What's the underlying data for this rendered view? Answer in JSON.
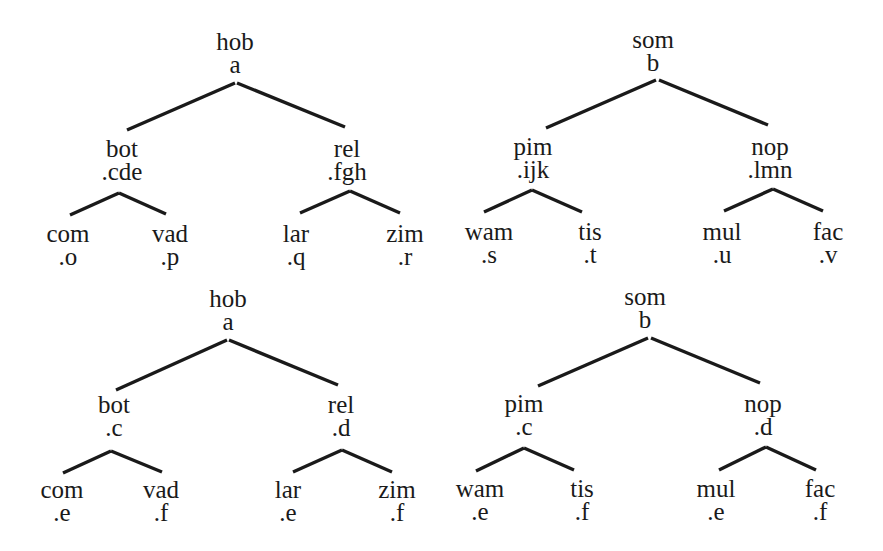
{
  "diagram": {
    "type": "tree-set",
    "colors": {
      "ink": "#1a1a1a",
      "background": "#ffffff"
    },
    "trees": [
      {
        "id": "top-left",
        "root": {
          "word": "hob",
          "tag": "a",
          "x": 235,
          "y": 30
        },
        "children": [
          {
            "word": "bot",
            "tag": ".cde",
            "x": 122,
            "y": 137,
            "children": [
              {
                "word": "com",
                "tag": ".o",
                "x": 68,
                "y": 222
              },
              {
                "word": "vad",
                "tag": ".p",
                "x": 170,
                "y": 222
              }
            ]
          },
          {
            "word": "rel",
            "tag": ".fgh",
            "x": 347,
            "y": 137,
            "children": [
              {
                "word": "lar",
                "tag": ".q",
                "x": 296,
                "y": 222
              },
              {
                "word": "zim",
                "tag": ".r",
                "x": 405,
                "y": 222
              }
            ]
          }
        ],
        "edges": [
          [
            235,
            83,
            127,
            130
          ],
          [
            237,
            83,
            345,
            127
          ],
          [
            119,
            193,
            70,
            215
          ],
          [
            119,
            193,
            166,
            214
          ],
          [
            350,
            191,
            300,
            213
          ],
          [
            350,
            191,
            400,
            213
          ]
        ]
      },
      {
        "id": "top-right",
        "root": {
          "word": "som",
          "tag": "b",
          "x": 653,
          "y": 28
        },
        "children": [
          {
            "word": "pim",
            "tag": ".ijk",
            "x": 533,
            "y": 135,
            "children": [
              {
                "word": "wam",
                "tag": ".s",
                "x": 489,
                "y": 220
              },
              {
                "word": "tis",
                "tag": ".t",
                "x": 590,
                "y": 220
              }
            ]
          },
          {
            "word": "nop",
            "tag": ".lmn",
            "x": 770,
            "y": 135,
            "children": [
              {
                "word": "mul",
                "tag": ".u",
                "x": 722,
                "y": 220
              },
              {
                "word": "fac",
                "tag": ".v",
                "x": 828,
                "y": 220
              }
            ]
          }
        ],
        "edges": [
          [
            656,
            80,
            546,
            128
          ],
          [
            659,
            80,
            768,
            125
          ],
          [
            532,
            190,
            484,
            212
          ],
          [
            532,
            190,
            582,
            212
          ],
          [
            773,
            189,
            724,
            211
          ],
          [
            773,
            189,
            823,
            211
          ]
        ]
      },
      {
        "id": "bottom-left",
        "root": {
          "word": "hob",
          "tag": "a",
          "x": 228,
          "y": 287
        },
        "children": [
          {
            "word": "bot",
            "tag": ".c",
            "x": 114,
            "y": 393,
            "children": [
              {
                "word": "com",
                "tag": ".e",
                "x": 62,
                "y": 478
              },
              {
                "word": "vad",
                "tag": ".f",
                "x": 161,
                "y": 478
              }
            ]
          },
          {
            "word": "rel",
            "tag": ".d",
            "x": 341,
            "y": 393,
            "children": [
              {
                "word": "lar",
                "tag": ".e",
                "x": 288,
                "y": 478
              },
              {
                "word": "zim",
                "tag": ".f",
                "x": 397,
                "y": 478
              }
            ]
          }
        ],
        "edges": [
          [
            227,
            340,
            116,
            390
          ],
          [
            229,
            340,
            338,
            385
          ],
          [
            111,
            451,
            63,
            473
          ],
          [
            111,
            451,
            162,
            472
          ],
          [
            342,
            450,
            293,
            472
          ],
          [
            342,
            450,
            392,
            472
          ]
        ]
      },
      {
        "id": "bottom-right",
        "root": {
          "word": "som",
          "tag": "b",
          "x": 645,
          "y": 285
        },
        "children": [
          {
            "word": "pim",
            "tag": ".c",
            "x": 524,
            "y": 392,
            "children": [
              {
                "word": "wam",
                "tag": ".e",
                "x": 480,
                "y": 477
              },
              {
                "word": "tis",
                "tag": ".f",
                "x": 582,
                "y": 477
              }
            ]
          },
          {
            "word": "nop",
            "tag": ".d",
            "x": 763,
            "y": 392,
            "children": [
              {
                "word": "mul",
                "tag": ".e",
                "x": 716,
                "y": 477
              },
              {
                "word": "fac",
                "tag": ".f",
                "x": 820,
                "y": 477
              }
            ]
          }
        ],
        "edges": [
          [
            648,
            338,
            538,
            386
          ],
          [
            651,
            338,
            760,
            383
          ],
          [
            524,
            448,
            476,
            471
          ],
          [
            524,
            448,
            574,
            470
          ],
          [
            766,
            447,
            719,
            470
          ],
          [
            766,
            447,
            816,
            470
          ]
        ]
      }
    ]
  }
}
